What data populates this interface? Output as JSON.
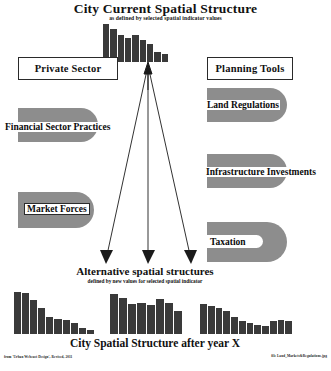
{
  "header": {
    "title": "City Current Spatial Structure",
    "subtitle": "as defined by selected spatial indicator values"
  },
  "middle": {
    "title": "Alternative spatial structures",
    "subtitle": "defined by new values for selected spatial indicator"
  },
  "footer_title": "City Spatial Structure after year X",
  "left_column": {
    "heading": "Private Sector",
    "items": [
      {
        "label": "Financial Sector Practices"
      },
      {
        "label": "Market Forces"
      }
    ]
  },
  "right_column": {
    "heading": "Planning Tools",
    "items": [
      {
        "label": "Land Regulations"
      },
      {
        "label": "Infrastructure Investments"
      },
      {
        "label": "Taxation"
      }
    ]
  },
  "credits": {
    "left": "from 'Urban Webcast Design', Revised, 2011",
    "right": "file Land_Markets&Regulations.jpg"
  },
  "colors": {
    "shape_fill": "#8d8d8d",
    "bar_fill": "#3a3a3a",
    "ink": "#111111",
    "paper": "#ffffff"
  },
  "chart_data": [
    {
      "id": "current-structure",
      "type": "bar",
      "title": "City Current Spatial Structure",
      "subtitle": "as defined by selected spatial indicator values",
      "categories": [
        "1",
        "2",
        "3",
        "4",
        "5",
        "6",
        "7",
        "8",
        "9"
      ],
      "values": [
        100,
        86,
        70,
        64,
        70,
        57,
        48,
        26,
        22
      ],
      "xlabel": "",
      "ylabel": "",
      "ylim": [
        0,
        100
      ],
      "grid": false,
      "legend": "none"
    },
    {
      "id": "alternative-a",
      "type": "bar",
      "title": "Alternative spatial structure A",
      "categories": [
        "1",
        "2",
        "3",
        "4",
        "5",
        "6",
        "7",
        "8",
        "9",
        "10"
      ],
      "values": [
        100,
        98,
        80,
        62,
        40,
        36,
        33,
        26,
        14,
        9
      ],
      "xlabel": "",
      "ylabel": "",
      "ylim": [
        0,
        100
      ],
      "grid": false,
      "legend": "none"
    },
    {
      "id": "alternative-b",
      "type": "bar",
      "title": "Alternative spatial structure B",
      "categories": [
        "1",
        "2",
        "3",
        "4",
        "5",
        "6",
        "7",
        "8"
      ],
      "values": [
        96,
        86,
        72,
        74,
        70,
        84,
        74,
        54
      ],
      "xlabel": "",
      "ylabel": "",
      "ylim": [
        0,
        100
      ],
      "grid": false,
      "legend": "none"
    },
    {
      "id": "alternative-c",
      "type": "bar",
      "title": "Alternative spatial structure C",
      "categories": [
        "1",
        "2",
        "3",
        "4",
        "5",
        "6",
        "7",
        "8",
        "9",
        "10",
        "11",
        "12"
      ],
      "values": [
        72,
        66,
        62,
        55,
        40,
        32,
        26,
        22,
        18,
        30,
        34,
        30
      ],
      "xlabel": "",
      "ylabel": "",
      "ylim": [
        0,
        100
      ],
      "grid": false,
      "legend": "none"
    }
  ]
}
